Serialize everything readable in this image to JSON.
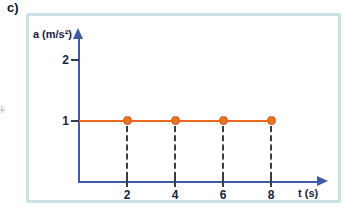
{
  "figure": {
    "panel_label": "c)"
  },
  "chart_data": {
    "type": "line",
    "title": "",
    "xlabel": "t (s)",
    "ylabel": "a (m/s²)",
    "series": [
      {
        "name": "acceleration",
        "x": [
          2,
          4,
          6,
          8
        ],
        "y": [
          1,
          1,
          1,
          1
        ],
        "line_span": {
          "x_start": 0,
          "x_end": 8,
          "y": 1
        },
        "marker": "circle"
      }
    ],
    "x_ticks": [
      "2",
      "4",
      "6",
      "8"
    ],
    "y_ticks": [
      "1",
      "2"
    ],
    "xlim": [
      0,
      10.25
    ],
    "ylim": [
      0,
      2.49
    ],
    "grid": false,
    "drop_lines": {
      "style": "dashed",
      "from_y": 1,
      "at_x": [
        2,
        4,
        6,
        8
      ]
    },
    "colors": {
      "axis": "#3e5aa8",
      "series_line": "#ee6a1f",
      "marker_fill": "#ef7125",
      "marker_edge": "#d05510",
      "drop_line": "#3d3d3d",
      "tick_mark": "#2e3a5c",
      "text": "#1b2342",
      "frame_border": "#cbdfe4"
    }
  }
}
